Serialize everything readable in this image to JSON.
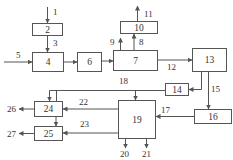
{
  "diagram": {
    "type": "process-flow-block-diagram",
    "boxes": [
      {
        "id": "2",
        "label": "2"
      },
      {
        "id": "4",
        "label": "4"
      },
      {
        "id": "6",
        "label": "6"
      },
      {
        "id": "7",
        "label": "7"
      },
      {
        "id": "10",
        "label": "10"
      },
      {
        "id": "13",
        "label": "13"
      },
      {
        "id": "14",
        "label": "14"
      },
      {
        "id": "16",
        "label": "16"
      },
      {
        "id": "19",
        "label": "19"
      },
      {
        "id": "24",
        "label": "24"
      },
      {
        "id": "25",
        "label": "25"
      }
    ],
    "arrows": [
      {
        "label": "1",
        "from": "input",
        "to": "2"
      },
      {
        "label": "3",
        "from": "2",
        "to": "4"
      },
      {
        "label": "5",
        "from": "input",
        "to": "4"
      },
      {
        "label": "",
        "from": "4",
        "to": "6"
      },
      {
        "label": "",
        "from": "6",
        "to": "7"
      },
      {
        "label": "8",
        "from": "7",
        "to": "10"
      },
      {
        "label": "9",
        "from": "7",
        "to": "output"
      },
      {
        "label": "11",
        "from": "10",
        "to": "output"
      },
      {
        "label": "12",
        "from": "7",
        "to": "13"
      },
      {
        "label": "",
        "from": "13",
        "to": "14"
      },
      {
        "label": "15",
        "from": "13",
        "to": "16"
      },
      {
        "label": "17",
        "from": "16",
        "to": "19"
      },
      {
        "label": "18",
        "from": "14",
        "to": "19 / 24"
      },
      {
        "label": "20",
        "from": "19",
        "to": "output"
      },
      {
        "label": "21",
        "from": "19",
        "to": "output"
      },
      {
        "label": "22",
        "from": "19",
        "to": "24"
      },
      {
        "label": "23",
        "from": "19",
        "to": "25"
      },
      {
        "label": "",
        "from": "24",
        "to": "25"
      },
      {
        "label": "26",
        "from": "24",
        "to": "output"
      },
      {
        "label": "27",
        "from": "25",
        "to": "output"
      }
    ]
  },
  "labels": {
    "b2": "2",
    "b4": "4",
    "b6": "6",
    "b7": "7",
    "b10": "10",
    "b13": "13",
    "b14": "14",
    "b16": "16",
    "b19": "19",
    "b24": "24",
    "b25": "25",
    "a1": "1",
    "a3": "3",
    "a5": "5",
    "a8": "8",
    "a9": "9",
    "a11": "11",
    "a12": "12",
    "a15": "15",
    "a17": "17",
    "a18": "18",
    "a20": "20",
    "a21": "21",
    "a22": "22",
    "a23": "23",
    "a26": "26",
    "a27": "27"
  }
}
